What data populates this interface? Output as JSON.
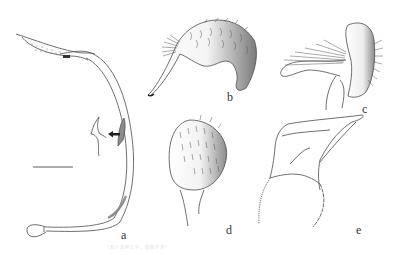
{
  "figure": {
    "panels": [
      {
        "id": "a",
        "label": "a",
        "description": "Long curved sclerite (phallus/aedeagus) with dotted apical region and small tooth; inset shows enlarged spine with arrow"
      },
      {
        "id": "b",
        "label": "b",
        "description": "Setose lobe (gonocoxite) with hooked process, shaded"
      },
      {
        "id": "c",
        "label": "c",
        "description": "Setose lobe in lateral view with long brush of setae"
      },
      {
        "id": "d",
        "label": "d",
        "description": "Oval setose plate on stalk, shaded on right"
      },
      {
        "id": "e",
        "label": "e",
        "description": "Outline of sclerite with rounded base and pointed apex"
      }
    ],
    "scale_bar": {
      "visible": true
    },
    "inset_arrow": {
      "direction": "left"
    },
    "caption": "（图片说明文字，模糊不清）"
  },
  "colors": {
    "line": "#4a4a4a",
    "shade_dark": "#6e6e6e",
    "background": "#ffffff"
  }
}
